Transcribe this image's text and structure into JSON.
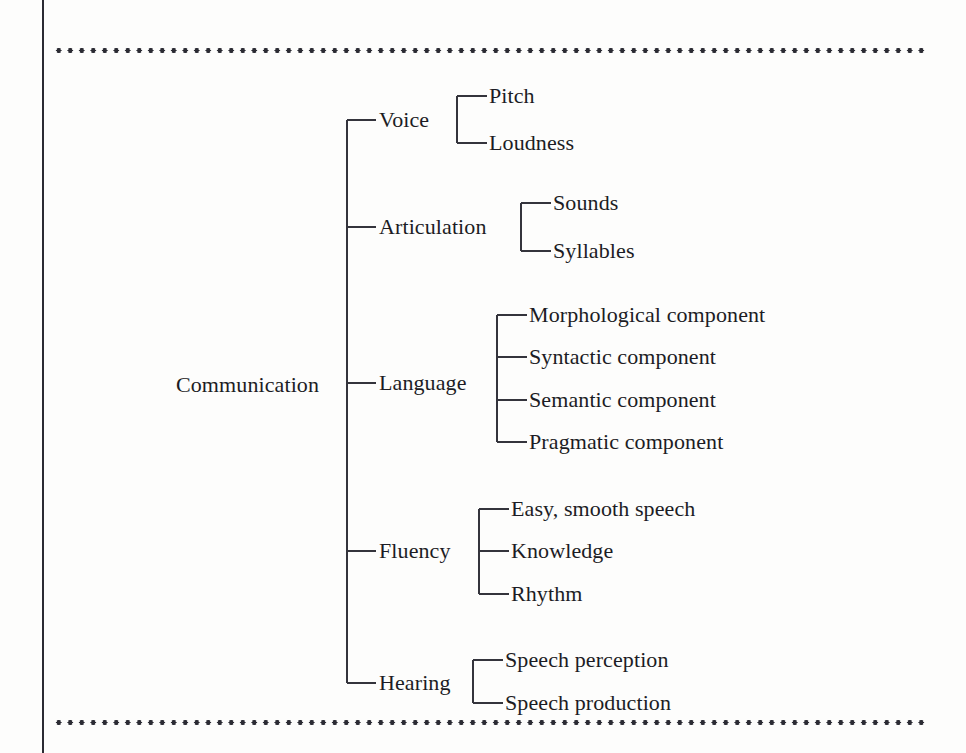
{
  "figure": {
    "kind": "hierarchical-tree-diagram",
    "background_color": "#fdfdfc",
    "line_color": "#34343c",
    "text_color": "#1c1c24",
    "rule_color": "#2b2b33"
  },
  "root": {
    "label": "Communication"
  },
  "branches": [
    {
      "label": "Voice",
      "children": [
        {
          "label": "Pitch"
        },
        {
          "label": "Loudness"
        }
      ]
    },
    {
      "label": "Articulation",
      "children": [
        {
          "label": "Sounds"
        },
        {
          "label": "Syllables"
        }
      ]
    },
    {
      "label": "Language",
      "children": [
        {
          "label": "Morphological component"
        },
        {
          "label": "Syntactic component"
        },
        {
          "label": "Semantic component"
        },
        {
          "label": "Pragmatic component"
        }
      ]
    },
    {
      "label": "Fluency",
      "children": [
        {
          "label": "Easy, smooth speech"
        },
        {
          "label": "Knowledge"
        },
        {
          "label": "Rhythm"
        }
      ]
    },
    {
      "label": "Hearing",
      "children": [
        {
          "label": "Speech perception"
        },
        {
          "label": "Speech production"
        }
      ]
    }
  ]
}
